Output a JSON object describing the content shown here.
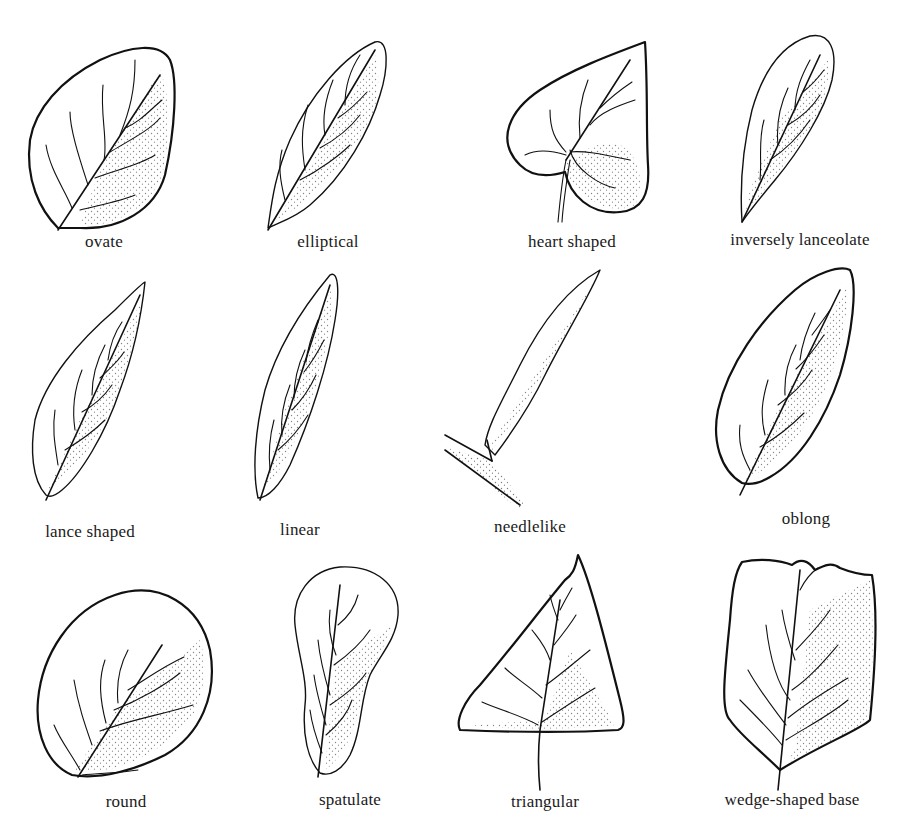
{
  "leaves": [
    {
      "label": "ovate"
    },
    {
      "label": "elliptical"
    },
    {
      "label": "heart shaped"
    },
    {
      "label": "inversely lanceolate"
    },
    {
      "label": "lance shaped"
    },
    {
      "label": "linear"
    },
    {
      "label": "needlelike"
    },
    {
      "label": "oblong"
    },
    {
      "label": "round"
    },
    {
      "label": "spatulate"
    },
    {
      "label": "triangular"
    },
    {
      "label": "wedge-shaped base"
    }
  ]
}
